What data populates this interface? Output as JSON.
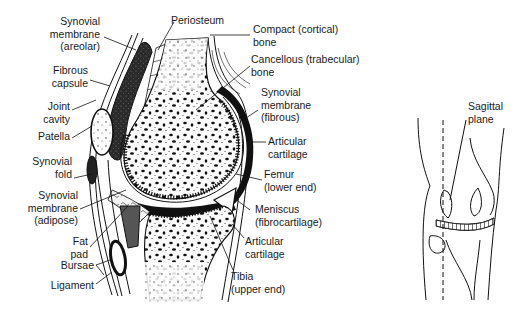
{
  "figure": {
    "left_labels": [
      {
        "id": "synovial-membrane-areolar",
        "lines": [
          "Synovial",
          "membrane",
          "(areolar)"
        ]
      },
      {
        "id": "fibrous-capsule",
        "lines": [
          "Fibrous",
          "capsule"
        ]
      },
      {
        "id": "joint-cavity",
        "lines": [
          "Joint",
          "cavity"
        ]
      },
      {
        "id": "patella",
        "lines": [
          "Patella"
        ]
      },
      {
        "id": "synovial-fold",
        "lines": [
          "Synovial",
          "fold"
        ]
      },
      {
        "id": "synovial-membrane-adipose",
        "lines": [
          "Synovial",
          "membrane",
          "(adipose)"
        ]
      },
      {
        "id": "fat-pad",
        "lines": [
          "Fat",
          "pad"
        ]
      },
      {
        "id": "bursae",
        "lines": [
          "Bursae"
        ]
      },
      {
        "id": "ligament",
        "lines": [
          "Ligament"
        ]
      }
    ],
    "top_labels": [
      {
        "id": "periosteum",
        "lines": [
          "Periosteum"
        ]
      }
    ],
    "right_labels": [
      {
        "id": "compact-bone",
        "lines": [
          "Compact (cortical)",
          "bone"
        ]
      },
      {
        "id": "cancellous-bone",
        "lines": [
          "Cancellous (trabecular)",
          "bone"
        ]
      },
      {
        "id": "synovial-membrane-fibrous",
        "lines": [
          "Synovial",
          "membrane",
          "(fibrous)"
        ]
      },
      {
        "id": "articular-cartilage-femur",
        "lines": [
          "Articular",
          "cartilage"
        ]
      },
      {
        "id": "femur",
        "lines": [
          "Femur",
          "(lower end)"
        ]
      },
      {
        "id": "meniscus",
        "lines": [
          "Meniscus",
          "(fibrocartilage)"
        ]
      },
      {
        "id": "articular-cartilage-tibia",
        "lines": [
          "Articular",
          "cartilage"
        ]
      },
      {
        "id": "tibia",
        "lines": [
          "Tibia",
          "(upper end)"
        ]
      }
    ],
    "inset": {
      "label_lines": [
        "Sagittal",
        "plane"
      ]
    }
  }
}
